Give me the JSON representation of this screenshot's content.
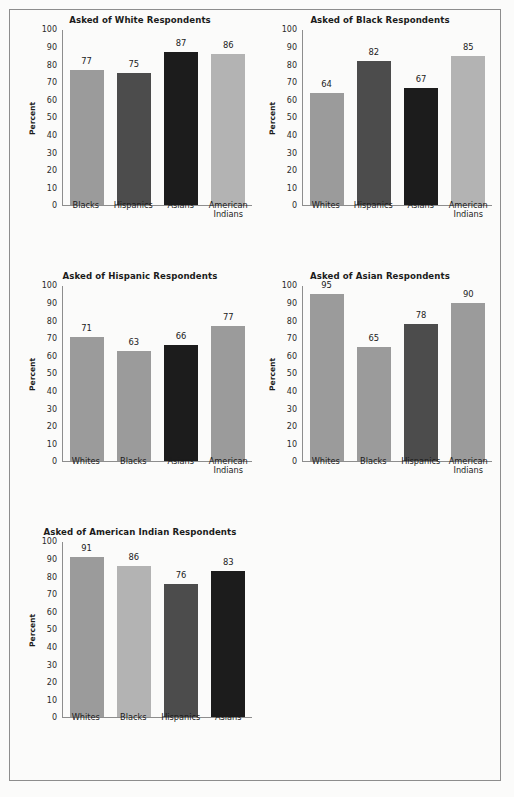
{
  "page": {
    "ylabel": "Percent",
    "y_ticks": [
      100,
      90,
      80,
      70,
      60,
      50,
      40,
      30,
      20,
      10,
      0
    ],
    "colors": {
      "light": "#b3b3b3",
      "mid": "#9b9b9b",
      "dark": "#4c4c4c",
      "black": "#1c1c1c",
      "axis": "#8d8d8d",
      "background": "#fbfbfa",
      "text": "#1b1b1b"
    }
  },
  "chart_data": [
    {
      "id": "white-respondents",
      "type": "bar",
      "title": "Asked of White Respondents",
      "xlabel": "",
      "ylabel": "Percent",
      "ylim": [
        0,
        100
      ],
      "grid": false,
      "categories": [
        "Blacks",
        "Hispanics",
        "Asians",
        "American\nIndians"
      ],
      "values": [
        77,
        75,
        87,
        86
      ],
      "bar_colors": [
        "#9b9b9b",
        "#4c4c4c",
        "#1c1c1c",
        "#b3b3b3"
      ]
    },
    {
      "id": "black-respondents",
      "type": "bar",
      "title": "Asked of Black Respondents",
      "xlabel": "",
      "ylabel": "Percent",
      "ylim": [
        0,
        100
      ],
      "grid": false,
      "categories": [
        "Whites",
        "Hispanics",
        "Asians",
        "American\nIndians"
      ],
      "values": [
        64,
        82,
        67,
        85
      ],
      "bar_colors": [
        "#9b9b9b",
        "#4c4c4c",
        "#1c1c1c",
        "#b3b3b3"
      ]
    },
    {
      "id": "hispanic-respondents",
      "type": "bar",
      "title": "Asked of Hispanic Respondents",
      "xlabel": "",
      "ylabel": "Percent",
      "ylim": [
        0,
        100
      ],
      "grid": false,
      "categories": [
        "Whites",
        "Blacks",
        "Asians",
        "American\nIndians"
      ],
      "values": [
        71,
        63,
        66,
        77
      ],
      "bar_colors": [
        "#9b9b9b",
        "#9b9b9b",
        "#1c1c1c",
        "#9b9b9b"
      ]
    },
    {
      "id": "asian-respondents",
      "type": "bar",
      "title": "Asked of Asian Respondents",
      "xlabel": "",
      "ylabel": "Percent",
      "ylim": [
        0,
        100
      ],
      "grid": false,
      "categories": [
        "Whites",
        "Blacks",
        "Hispanics",
        "American\nIndians"
      ],
      "values": [
        95,
        65,
        78,
        90
      ],
      "bar_colors": [
        "#9b9b9b",
        "#9b9b9b",
        "#4c4c4c",
        "#9b9b9b"
      ]
    },
    {
      "id": "american-indian-respondents",
      "type": "bar",
      "title": "Asked of American Indian Respondents",
      "title_superscript": "1",
      "xlabel": "",
      "ylabel": "Percent",
      "ylim": [
        0,
        100
      ],
      "grid": false,
      "categories": [
        "Whites",
        "Blacks",
        "Hispanics",
        "Asians"
      ],
      "values": [
        91,
        86,
        76,
        83
      ],
      "bar_colors": [
        "#9b9b9b",
        "#b3b3b3",
        "#4c4c4c",
        "#1c1c1c"
      ]
    }
  ]
}
